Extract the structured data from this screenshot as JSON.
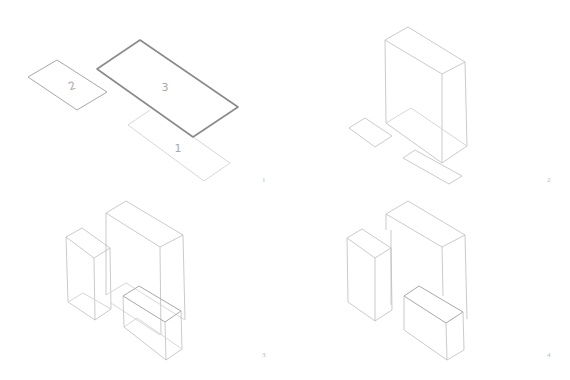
{
  "figure": {
    "colors": {
      "background": "#ffffff",
      "pencil_light": "#bdbdbd",
      "pencil_dark": "#8a8a8a"
    },
    "panels": [
      {
        "step_label": "1",
        "shape_labels": [
          {
            "text": "2",
            "x": 65,
            "y": 85
          },
          {
            "text": "3",
            "x": 165,
            "y": 87
          },
          {
            "text": "1",
            "x": 178,
            "y": 148
          }
        ]
      },
      {
        "step_label": "2",
        "shape_labels": []
      },
      {
        "step_label": "3",
        "shape_labels": []
      },
      {
        "step_label": "4",
        "shape_labels": []
      }
    ]
  }
}
